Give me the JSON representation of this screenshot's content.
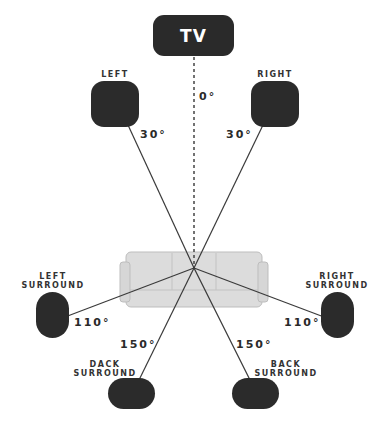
{
  "diagram": {
    "tv": {
      "label": "TV",
      "angle": "0°"
    },
    "speakers": {
      "left": {
        "label": "LEFT",
        "angle": "30°"
      },
      "right": {
        "label": "RIGHT",
        "angle": "30°"
      },
      "left_surround": {
        "label": "LEFT\nSURROUND",
        "angle": "110°"
      },
      "right_surround": {
        "label": "RIGHT\nSURROUND",
        "angle": "110°"
      },
      "back_left": {
        "label": "DACK\nSURROUND",
        "angle": "150°"
      },
      "back_right": {
        "label": "BACK\nSURROUND",
        "angle": "150°"
      }
    },
    "listener": {
      "icon": "sofa-icon"
    },
    "colors": {
      "speaker": "#2b2b2b",
      "line": "#3a3a3a",
      "sofa": "#d9d9d9",
      "sofa_outline": "#bcbcbc",
      "background": "#ffffff"
    }
  }
}
